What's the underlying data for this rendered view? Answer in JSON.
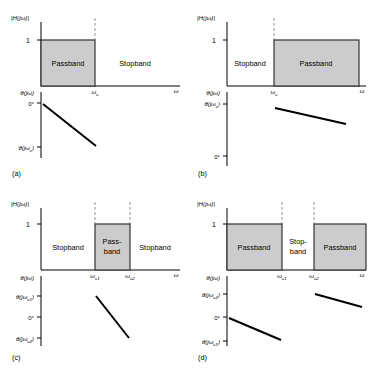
{
  "figure": {
    "background": "#ffffff",
    "band_fill": "#cccccc",
    "band_stroke": "#333333",
    "axis_color": "#000000",
    "dash_color": "#999999",
    "phase_line_color": "#000000"
  },
  "axis_labels": {
    "magnitude": "|H(jω)|",
    "omega": "ω",
    "one": "1",
    "zero_deg": "0°",
    "theta": "θ(jω)",
    "theta_c": "θ(jωc)",
    "theta_c1": "θ(jωc1)",
    "theta_c2": "θ(jωc2)",
    "omega_c": "ωc",
    "omega_c1": "ωc1",
    "omega_c2": "ωc2"
  },
  "panels": [
    {
      "id": "a",
      "caption": "(a)",
      "filter_type": "lowpass",
      "bands": [
        {
          "label": "Passband",
          "kind": "pass",
          "x_start": 0.0,
          "x_end": 0.42
        },
        {
          "label": "Stopband",
          "kind": "stop",
          "x_start": 0.42,
          "x_end": 1.0
        }
      ],
      "cutoffs": [
        "ωc"
      ],
      "magnitude_level": "1",
      "phase_axis_ticks": [
        "0°",
        "θ(jωc)"
      ],
      "phase_segments": [
        {
          "from_label": "0°",
          "to_label": "θ(jωc)",
          "slope": "negative"
        }
      ]
    },
    {
      "id": "b",
      "caption": "(b)",
      "filter_type": "highpass",
      "bands": [
        {
          "label": "Stopband",
          "kind": "stop",
          "x_start": 0.0,
          "x_end": 0.38
        },
        {
          "label": "Passband",
          "kind": "pass",
          "x_start": 0.38,
          "x_end": 1.0
        }
      ],
      "cutoffs": [
        "ωc"
      ],
      "magnitude_level": "1",
      "phase_axis_ticks": [
        "θ(jωc)",
        "0°"
      ],
      "phase_segments": [
        {
          "from_label": "θ(jωc)",
          "to_label": "",
          "slope": "negative"
        }
      ]
    },
    {
      "id": "c",
      "caption": "(c)",
      "filter_type": "bandpass",
      "bands": [
        {
          "label": "Stopband",
          "kind": "stop",
          "x_start": 0.0,
          "x_end": 0.36
        },
        {
          "label": "Pass-band",
          "kind": "pass",
          "x_start": 0.36,
          "x_end": 0.62
        },
        {
          "label": "Stopband",
          "kind": "stop",
          "x_start": 0.62,
          "x_end": 1.0
        }
      ],
      "cutoffs": [
        "ωc1",
        "ωc2"
      ],
      "magnitude_level": "1",
      "phase_axis_ticks": [
        "θ(jωc1)",
        "0°",
        "θ(jωc2)"
      ],
      "phase_segments": [
        {
          "from_label": "θ(jωc1)",
          "to_label": "θ(jωc2)",
          "slope": "negative"
        }
      ]
    },
    {
      "id": "d",
      "caption": "(d)",
      "filter_type": "bandstop",
      "bands": [
        {
          "label": "Passband",
          "kind": "pass",
          "x_start": 0.0,
          "x_end": 0.4
        },
        {
          "label": "Stop-band",
          "kind": "stop",
          "x_start": 0.4,
          "x_end": 0.55
        },
        {
          "label": "Passband",
          "kind": "pass",
          "x_start": 0.55,
          "x_end": 1.0
        }
      ],
      "cutoffs": [
        "ωc1",
        "ωc2"
      ],
      "magnitude_level": "1",
      "phase_axis_ticks": [
        "θ(jωc2)",
        "0°",
        "θ(jωc1)"
      ],
      "phase_segments": [
        {
          "from_label": "0°",
          "to_label": "θ(jωc1)",
          "slope": "negative"
        },
        {
          "from_label": "θ(jωc2)",
          "to_label": "",
          "slope": "negative"
        }
      ]
    }
  ]
}
